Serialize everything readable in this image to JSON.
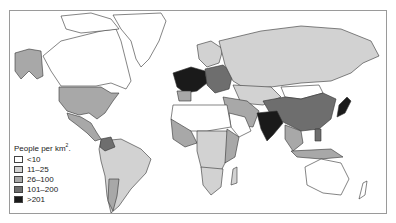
{
  "map": {
    "title": "World population density",
    "legend": {
      "title": "People per km",
      "title_superscript": "2",
      "title_suffix": ".",
      "items": [
        {
          "label": "<10",
          "color": "#ffffff"
        },
        {
          "label": "11–25",
          "color": "#d2d2d2"
        },
        {
          "label": "26–100",
          "color": "#a8a8a8"
        },
        {
          "label": "101–200",
          "color": "#6e6e6e"
        },
        {
          "label": ">201",
          "color": "#1a1a1a"
        }
      ]
    },
    "colors": {
      "border": "#333333",
      "frame": "#9a9a9a",
      "c1": "#ffffff",
      "c2": "#d2d2d2",
      "c3": "#a8a8a8",
      "c4": "#6e6e6e",
      "c5": "#1a1a1a"
    }
  }
}
